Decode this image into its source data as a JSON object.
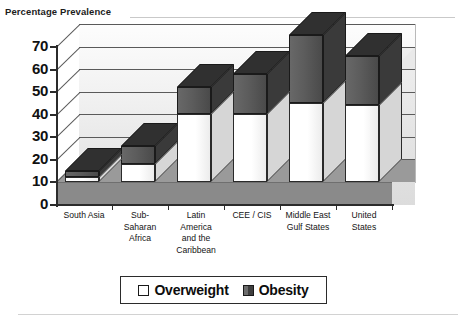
{
  "chart_data": {
    "type": "bar",
    "subtype": "stacked-3d-column",
    "title": "",
    "axis_title": "Percentage Prevalence",
    "xlabel": "",
    "ylabel": "Percentage Prevalence",
    "ylim": [
      0,
      70
    ],
    "yticks": [
      0,
      10,
      20,
      30,
      40,
      50,
      60,
      70
    ],
    "ytick_labels": [
      "0",
      "10",
      "20",
      "30",
      "40",
      "50",
      "60",
      "70"
    ],
    "grid": true,
    "grid_axis": "y",
    "legend_position": "bottom",
    "categories": [
      "South Asia",
      "Sub-Saharan Africa",
      "Latin America and the Caribbean",
      "CEE / CIS",
      "Middle East Gulf States",
      "United States"
    ],
    "category_label_lines": [
      [
        "South Asia"
      ],
      [
        "Sub-",
        "Saharan",
        "Africa"
      ],
      [
        "Latin",
        "America",
        "and the",
        "Caribbean"
      ],
      [
        "CEE / CIS"
      ],
      [
        "Middle East",
        "Gulf States"
      ],
      [
        "United",
        "States"
      ]
    ],
    "series": [
      {
        "name": "Overweight",
        "color": "#ffffff",
        "values": [
          2,
          8,
          30,
          30,
          35,
          34
        ]
      },
      {
        "name": "Obesity",
        "color": "#4a4a4a",
        "values": [
          3,
          8,
          12,
          18,
          30,
          22
        ]
      }
    ],
    "totals": [
      5,
      16,
      42,
      48,
      65,
      56
    ]
  },
  "legend": {
    "items": [
      {
        "label": "Overweight",
        "swatch": "white-square-swatch"
      },
      {
        "label": "Obesity",
        "swatch": "dark-square-swatch"
      }
    ]
  }
}
